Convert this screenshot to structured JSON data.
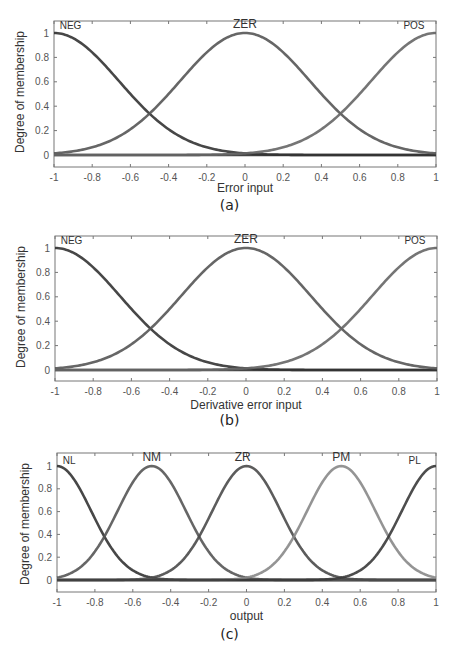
{
  "chart_data": [
    {
      "id": "a",
      "type": "line",
      "title": "",
      "caption": "(a)",
      "xlabel": "Error input",
      "ylabel": "Degree of membership",
      "xlim": [
        -1,
        1
      ],
      "ylim": [
        -0.1,
        1.1
      ],
      "xticks": [
        "-1",
        "-0.8",
        "-0.6",
        "-0.4",
        "-0.2",
        "0",
        "0.2",
        "0.4",
        "0.6",
        "0.8",
        "1"
      ],
      "yticks": [
        "0",
        "0.2",
        "0.4",
        "0.6",
        "0.8",
        "1"
      ],
      "grid": false,
      "series": [
        {
          "name": "NEG",
          "shape": "gaussian",
          "center": -1,
          "sigma": 0.34,
          "color": "#333333"
        },
        {
          "name": "ZER",
          "shape": "gaussian",
          "center": 0,
          "sigma": 0.34,
          "color": "#555555"
        },
        {
          "name": "POS",
          "shape": "gaussian",
          "center": 1,
          "sigma": 0.34,
          "color": "#666666"
        }
      ],
      "baseline": {
        "y": 0,
        "color": "#444444"
      },
      "labels": [
        {
          "text": "NEG",
          "x": -0.97,
          "y": 1.03,
          "anchor": "start"
        },
        {
          "text": "ZER",
          "x": 0,
          "y": 1.04,
          "anchor": "middle"
        },
        {
          "text": "POS",
          "x": 0.94,
          "y": 1.03,
          "anchor": "end"
        }
      ]
    },
    {
      "id": "b",
      "type": "line",
      "title": "",
      "caption": "(b)",
      "xlabel": "Derivative error input",
      "ylabel": "Degree of membership",
      "xlim": [
        -1,
        1
      ],
      "ylim": [
        -0.1,
        1.1
      ],
      "xticks": [
        "-1",
        "-0.8",
        "-0.6",
        "-0.4",
        "-0.2",
        "0",
        "0.2",
        "0.4",
        "0.6",
        "0.8",
        "1"
      ],
      "yticks": [
        "0",
        "0.2",
        "0.4",
        "0.6",
        "0.8",
        "1"
      ],
      "grid": false,
      "series": [
        {
          "name": "NEG",
          "shape": "gaussian",
          "center": -1,
          "sigma": 0.34,
          "color": "#333333"
        },
        {
          "name": "ZER",
          "shape": "gaussian",
          "center": 0,
          "sigma": 0.34,
          "color": "#555555"
        },
        {
          "name": "POS",
          "shape": "gaussian",
          "center": 1,
          "sigma": 0.34,
          "color": "#666666"
        }
      ],
      "baseline": {
        "y": 0,
        "color": "#444444"
      },
      "labels": [
        {
          "text": "NEG",
          "x": -0.97,
          "y": 1.03,
          "anchor": "start"
        },
        {
          "text": "ZER",
          "x": 0,
          "y": 1.04,
          "anchor": "middle"
        },
        {
          "text": "POS",
          "x": 0.94,
          "y": 1.03,
          "anchor": "end"
        }
      ]
    },
    {
      "id": "c",
      "type": "line",
      "title": "",
      "caption": "(c)",
      "xlabel": "output",
      "ylabel": "Degree of membership",
      "xlim": [
        -1,
        1
      ],
      "ylim": [
        -0.1,
        1.1
      ],
      "xticks": [
        "-1",
        "-0.8",
        "-0.6",
        "-0.4",
        "-0.2",
        "0",
        "0.2",
        "0.4",
        "0.6",
        "0.8",
        "1"
      ],
      "yticks": [
        "0",
        "0.2",
        "0.4",
        "0.6",
        "0.8",
        "1"
      ],
      "grid": false,
      "series": [
        {
          "name": "NL",
          "shape": "gaussian",
          "center": -1,
          "sigma": 0.18,
          "color": "#333333"
        },
        {
          "name": "NM",
          "shape": "gaussian",
          "center": -0.5,
          "sigma": 0.18,
          "color": "#555555"
        },
        {
          "name": "ZR",
          "shape": "gaussian",
          "center": 0,
          "sigma": 0.18,
          "color": "#4a4a4a"
        },
        {
          "name": "PM",
          "shape": "gaussian",
          "center": 0.5,
          "sigma": 0.18,
          "color": "#888888"
        },
        {
          "name": "PL",
          "shape": "gaussian",
          "center": 1,
          "sigma": 0.18,
          "color": "#3a3a3a"
        }
      ],
      "baseline": {
        "y": 0,
        "color": "#444444"
      },
      "labels": [
        {
          "text": "NL",
          "x": -0.97,
          "y": 1.02,
          "anchor": "start"
        },
        {
          "text": "NM",
          "x": -0.5,
          "y": 1.04,
          "anchor": "middle"
        },
        {
          "text": "ZR",
          "x": -0.02,
          "y": 1.04,
          "anchor": "middle"
        },
        {
          "text": "PM",
          "x": 0.5,
          "y": 1.04,
          "anchor": "middle"
        },
        {
          "text": "PL",
          "x": 0.92,
          "y": 1.02,
          "anchor": "end"
        }
      ]
    }
  ]
}
